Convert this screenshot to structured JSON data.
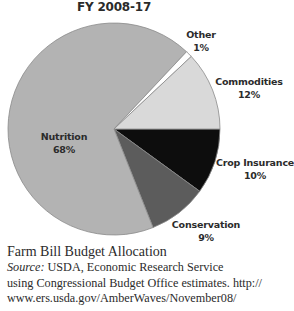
{
  "chart_data": {
    "type": "pie",
    "title": "FY 2008-17",
    "caption_title": "Farm Bill Budget Allocation",
    "slices": [
      {
        "label": "Crop Insurance",
        "value": 10,
        "display": "10%",
        "color": "#0d0d0d"
      },
      {
        "label": "Conservation",
        "value": 9,
        "display": "9%",
        "color": "#5c5c5c"
      },
      {
        "label": "Nutrition",
        "value": 68,
        "display": "68%",
        "color": "#b3b3b3"
      },
      {
        "label": "Other",
        "value": 1,
        "display": "1%",
        "color": "#ffffff"
      },
      {
        "label": "Commodities",
        "value": 12,
        "display": "12%",
        "color": "#d9d9d9"
      }
    ],
    "start_angle_deg": 0,
    "direction": "clockwise",
    "legend": "none (inline labels)"
  },
  "header": {
    "title": "FY 2008-17"
  },
  "labels": {
    "other": {
      "name": "Other",
      "pct": "1%"
    },
    "commodities": {
      "name": "Commodities",
      "pct": "12%"
    },
    "crop_insurance": {
      "name": "Crop Insurance",
      "pct": "10%"
    },
    "conservation": {
      "name": "Conservation",
      "pct": "9%"
    },
    "nutrition": {
      "name": "Nutrition",
      "pct": "68%"
    }
  },
  "caption": {
    "title": "Farm Bill Budget Allocation",
    "source_label": "Source:",
    "source_line1": " USDA, Economic Research Service",
    "source_line2": "using Congressional Budget Office estimates. http://",
    "source_line3": "www.ers.usda.gov/AmberWaves/November08/"
  }
}
